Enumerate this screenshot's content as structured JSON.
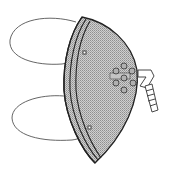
{
  "illustration": {
    "subject": "respirator face mask",
    "colors": {
      "background": "#ffffff",
      "outline": "#2a2a2a",
      "shell_fill": "#b9b9b9",
      "rim_fill": "#c6c6c6",
      "strap": "#555555",
      "valve_hole": "#9c9c9c"
    },
    "parts": {
      "straps": 2,
      "valve_holes": 7,
      "connector_segments": 5
    }
  }
}
